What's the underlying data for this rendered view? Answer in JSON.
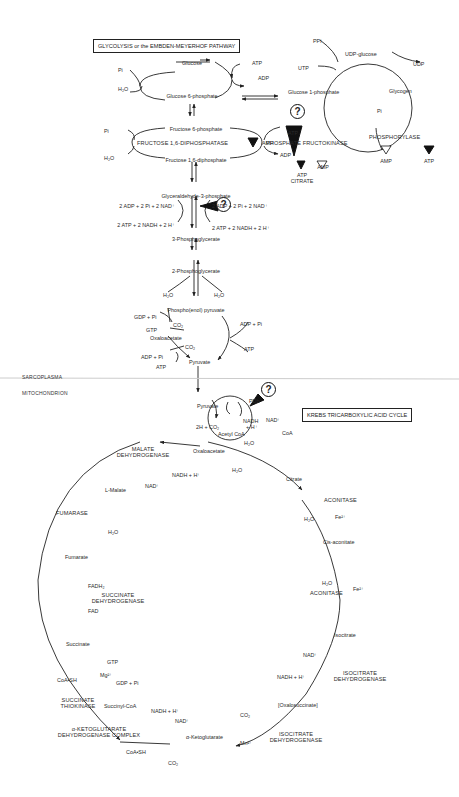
{
  "titles": {
    "glycolysis": "GLYCOLYSIS or the EMBDEN-MEYERHOF PATHWAY",
    "krebs": "KREBS TRICARBOXYLIC ACID CYCLE"
  },
  "regions": {
    "sarcoplasma": "SARCOPLASMA",
    "mitochondrion": "MITOCHONDRION"
  },
  "question_mark": "?",
  "glycolysis": {
    "glucose": "Glucose",
    "g6p": "Glucose 6-phosphate",
    "f6p": "Fructose 6-phosphate",
    "f16dp": "Fructose 1,6-diphosphate",
    "gap": "Glyceraldehyde-3-phosphate",
    "pg3": "3-Phosphoglycerate",
    "pg2": "2-Phosphoglycerate",
    "pep": "Phospho(enol) pyruvate",
    "oxaloacetate": "Oxaloacetate",
    "pyruvate": "Pyruvate",
    "pi_1": "Pi",
    "h2o_1": "H₂O",
    "atp_1": "ATP",
    "adp_1": "ADP",
    "pi_2": "Pi",
    "h2o_2": "H₂O",
    "fdpase": "FRUCTOSE 1,6-DIPHOSPHATASE",
    "amp_1": "AMP",
    "atp_2": "ATP",
    "adp_2": "ADP",
    "pfk": "PHOSPHATE FRUCTOKINASE",
    "pfk_inh": [
      "ATP",
      "CITRATE"
    ],
    "pfk_act": "AMP",
    "gap_left_in": "2 ADP + 2 Pi + 2 NAD⁺",
    "gap_left_out": "2 ATP + 2 NADH + 2 H⁺",
    "gap_right_in": "2 ADP + 2 Pi + 2 NAD⁺",
    "gap_right_out": "2 ATP + 2 NADH + 2 H⁺",
    "h2o_left": "H₂O",
    "h2o_right": "H₂O",
    "gdp_pi": "GDP + Pi",
    "gtp": "GTP",
    "co2_1": "CO₂",
    "adp_pi_1": "ADP + Pi",
    "atp_3": "ATP",
    "co2_2": "CO₂",
    "adp_pi_2": "ADP + Pi",
    "atp_4": "ATP",
    "atp_5": "ATP"
  },
  "glycogen": {
    "g1p": "Glucose 1-phosphate",
    "udp_glucose": "UDP-glucose",
    "glycogen": "Glycogen",
    "ppi": "PPi",
    "utp": "UTP",
    "udp": "UDP",
    "pi": "Pi",
    "phosphorylase": "PHOSPHORYLASE",
    "amp": "AMP",
    "atp": "ATP"
  },
  "pdh": {
    "pyruvate": "Pyruvate",
    "co2": "2H + CO₂",
    "pdh": "PDh",
    "nadh": "NADH",
    "h": "+ H⁺",
    "nad": "NAD⁺",
    "acetyl_coa": "Acetyl CoA",
    "coa": "CoA",
    "h2o": "H₂O"
  },
  "krebs": {
    "oxaloacetate": "Oxaloacetate",
    "citrate": "Citrate",
    "h2o_cs": "H₂O",
    "aconitase_1": "ACONITASE",
    "h2o_a1": "H₂O",
    "fe_1": "Fe²⁺",
    "cis_aconitate": "Cis-aconitate",
    "h2o_a2": "H₂O",
    "aconitase_2": "ACONITASE",
    "fe_2": "Fe²⁺",
    "isocitrate": "Isocitrate",
    "nad_idh": "NAD⁺",
    "nadh_idh": "NADH + H⁺",
    "idh_1": [
      "ISOCITRATE",
      "DEHYDROGENASE"
    ],
    "oxalosuccinate": "[Oxalosuccinate]",
    "co2_idh": "CO₂",
    "mn": "Mn²⁺",
    "idh_2": [
      "ISOCITRATE",
      "DEHYDROGENASE"
    ],
    "akg": "α-Ketoglutarate",
    "nadh_akg": "NADH + H⁺",
    "nad_akg": "NAD⁺",
    "akgdh": [
      "α-KETOGLUTARATE",
      "DEHYDROGENASE COMPLEX"
    ],
    "coash_akg": "CoA•SH",
    "co2_akg": "CO₂",
    "succinyl_coa": "Succinyl-CoA",
    "stk": [
      "SUCCINATE",
      "THIOKINASE"
    ],
    "gtp": "GTP",
    "mg": "Mg²⁺",
    "gdp_pi": "GDP + Pi",
    "coash_stk": "CoA•SH",
    "succinate": "Succinate",
    "fadh2": "FADH₂",
    "sdh": [
      "SUCCINATE",
      "DEHYDROGENASE"
    ],
    "fad": "FAD",
    "fumarate": "Fumarate",
    "fumarase": "FUMARASE",
    "h2o_fum": "H₂O",
    "l_malate": "L-Malate",
    "mdh": [
      "MALATE",
      "DEHYDROGENASE"
    ],
    "nad_mdh": "NAD⁺",
    "nadh_mdh": "NADH + H⁺"
  }
}
